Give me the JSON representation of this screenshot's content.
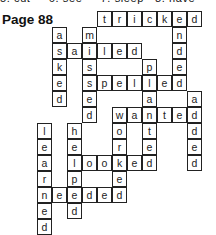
{
  "header": {
    "top_fragment": "5. cut     6. see     7. sleep   8. have",
    "page_label": "Page 88"
  },
  "grid": {
    "origin_x": 37,
    "origin_y": 11,
    "cell_w": 15,
    "cell_h": 16,
    "words": [
      {
        "word": "tricked",
        "dir": "across",
        "row": 0,
        "col": 4
      },
      {
        "word": "asked",
        "dir": "down",
        "row": 1,
        "col": 1
      },
      {
        "word": "missed",
        "dir": "down",
        "row": 1,
        "col": 3
      },
      {
        "word": "ended",
        "dir": "down",
        "row": 0,
        "col": 9
      },
      {
        "word": "sailed",
        "dir": "across",
        "row": 2,
        "col": 1
      },
      {
        "word": "planted",
        "dir": "down",
        "row": 3,
        "col": 7
      },
      {
        "word": "spelled",
        "dir": "across",
        "row": 4,
        "col": 3
      },
      {
        "word": "added",
        "dir": "down",
        "row": 5,
        "col": 10
      },
      {
        "word": "wanted",
        "dir": "across",
        "row": 6,
        "col": 5
      },
      {
        "word": "worked",
        "dir": "down",
        "row": 6,
        "col": 5
      },
      {
        "word": "learned",
        "dir": "down",
        "row": 7,
        "col": 0
      },
      {
        "word": "helped",
        "dir": "down",
        "row": 7,
        "col": 2
      },
      {
        "word": "looked",
        "dir": "across",
        "row": 9,
        "col": 2
      },
      {
        "word": "needed",
        "dir": "across",
        "row": 11,
        "col": 0
      }
    ],
    "cells": [
      {
        "r": 0,
        "c": 4,
        "ch": "t"
      },
      {
        "r": 0,
        "c": 5,
        "ch": "r"
      },
      {
        "r": 0,
        "c": 6,
        "ch": "i"
      },
      {
        "r": 0,
        "c": 7,
        "ch": "c"
      },
      {
        "r": 0,
        "c": 8,
        "ch": "k"
      },
      {
        "r": 0,
        "c": 9,
        "ch": "e"
      },
      {
        "r": 0,
        "c": 10,
        "ch": "d"
      },
      {
        "r": 1,
        "c": 1,
        "ch": "a"
      },
      {
        "r": 1,
        "c": 3,
        "ch": "m"
      },
      {
        "r": 1,
        "c": 9,
        "ch": "n"
      },
      {
        "r": 2,
        "c": 1,
        "ch": "s"
      },
      {
        "r": 2,
        "c": 2,
        "ch": "a"
      },
      {
        "r": 2,
        "c": 3,
        "ch": "i"
      },
      {
        "r": 2,
        "c": 4,
        "ch": "l"
      },
      {
        "r": 2,
        "c": 5,
        "ch": "e"
      },
      {
        "r": 2,
        "c": 6,
        "ch": "d"
      },
      {
        "r": 2,
        "c": 9,
        "ch": "d"
      },
      {
        "r": 3,
        "c": 1,
        "ch": "k"
      },
      {
        "r": 3,
        "c": 3,
        "ch": "s"
      },
      {
        "r": 3,
        "c": 7,
        "ch": "p"
      },
      {
        "r": 3,
        "c": 9,
        "ch": "e"
      },
      {
        "r": 4,
        "c": 1,
        "ch": "e"
      },
      {
        "r": 4,
        "c": 3,
        "ch": "s"
      },
      {
        "r": 4,
        "c": 4,
        "ch": "p"
      },
      {
        "r": 4,
        "c": 5,
        "ch": "e"
      },
      {
        "r": 4,
        "c": 6,
        "ch": "l"
      },
      {
        "r": 4,
        "c": 7,
        "ch": "l"
      },
      {
        "r": 4,
        "c": 8,
        "ch": "e"
      },
      {
        "r": 4,
        "c": 9,
        "ch": "d"
      },
      {
        "r": 5,
        "c": 1,
        "ch": "d"
      },
      {
        "r": 5,
        "c": 3,
        "ch": "e"
      },
      {
        "r": 5,
        "c": 7,
        "ch": "a"
      },
      {
        "r": 5,
        "c": 10,
        "ch": "a"
      },
      {
        "r": 6,
        "c": 3,
        "ch": "d"
      },
      {
        "r": 6,
        "c": 5,
        "ch": "w"
      },
      {
        "r": 6,
        "c": 6,
        "ch": "a"
      },
      {
        "r": 6,
        "c": 7,
        "ch": "n"
      },
      {
        "r": 6,
        "c": 8,
        "ch": "t"
      },
      {
        "r": 6,
        "c": 9,
        "ch": "e"
      },
      {
        "r": 6,
        "c": 10,
        "ch": "d"
      },
      {
        "r": 7,
        "c": 0,
        "ch": "l"
      },
      {
        "r": 7,
        "c": 2,
        "ch": "h"
      },
      {
        "r": 7,
        "c": 5,
        "ch": "o"
      },
      {
        "r": 7,
        "c": 7,
        "ch": "t"
      },
      {
        "r": 7,
        "c": 10,
        "ch": "d"
      },
      {
        "r": 8,
        "c": 0,
        "ch": "e"
      },
      {
        "r": 8,
        "c": 2,
        "ch": "e"
      },
      {
        "r": 8,
        "c": 5,
        "ch": "r"
      },
      {
        "r": 8,
        "c": 7,
        "ch": "e"
      },
      {
        "r": 8,
        "c": 10,
        "ch": "e"
      },
      {
        "r": 9,
        "c": 0,
        "ch": "a"
      },
      {
        "r": 9,
        "c": 2,
        "ch": "l"
      },
      {
        "r": 9,
        "c": 3,
        "ch": "o"
      },
      {
        "r": 9,
        "c": 4,
        "ch": "o"
      },
      {
        "r": 9,
        "c": 5,
        "ch": "k"
      },
      {
        "r": 9,
        "c": 6,
        "ch": "e"
      },
      {
        "r": 9,
        "c": 7,
        "ch": "d"
      },
      {
        "r": 9,
        "c": 10,
        "ch": "d"
      },
      {
        "r": 10,
        "c": 0,
        "ch": "r"
      },
      {
        "r": 10,
        "c": 2,
        "ch": "p"
      },
      {
        "r": 10,
        "c": 5,
        "ch": "e"
      },
      {
        "r": 11,
        "c": 0,
        "ch": "n"
      },
      {
        "r": 11,
        "c": 1,
        "ch": "e"
      },
      {
        "r": 11,
        "c": 2,
        "ch": "e"
      },
      {
        "r": 11,
        "c": 3,
        "ch": "d"
      },
      {
        "r": 11,
        "c": 4,
        "ch": "e"
      },
      {
        "r": 11,
        "c": 5,
        "ch": "d"
      },
      {
        "r": 12,
        "c": 0,
        "ch": "e"
      },
      {
        "r": 12,
        "c": 2,
        "ch": "d"
      },
      {
        "r": 13,
        "c": 0,
        "ch": "d"
      }
    ]
  },
  "colors": {
    "background": "#ffffff",
    "grid_line": "#222222",
    "text": "#222222"
  }
}
